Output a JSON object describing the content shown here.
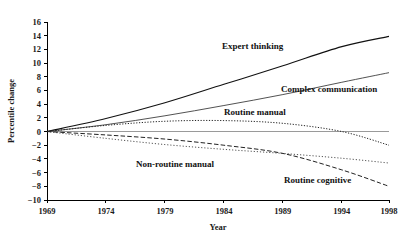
{
  "chart_data": {
    "type": "line",
    "title": "",
    "xlabel": "Year",
    "ylabel": "Percentile change",
    "x": [
      1969,
      1974,
      1979,
      1984,
      1989,
      1994,
      1998
    ],
    "xtick_labels": [
      "1969",
      "1974",
      "1979",
      "1984",
      "1989",
      "1994",
      "1998"
    ],
    "ytick_labels": [
      "16",
      "14",
      "12",
      "10",
      "8",
      "6",
      "4",
      "2",
      "0",
      "-2",
      "-4",
      "-6",
      "-8",
      "-10"
    ],
    "xlim": [
      1969,
      1998
    ],
    "ylim": [
      -10,
      16
    ],
    "grid": false,
    "legend_position": "inline-annotations",
    "series": [
      {
        "name": "Expert thinking",
        "label": "Expert thinking",
        "style": "solid",
        "values": [
          0.0,
          1.9,
          4.2,
          6.9,
          9.6,
          12.4,
          13.9
        ]
      },
      {
        "name": "Complex communication",
        "label": "Complex communication",
        "style": "solid-thin",
        "values": [
          0.0,
          1.0,
          2.3,
          3.8,
          5.4,
          7.2,
          8.6
        ]
      },
      {
        "name": "Routine manual",
        "label": "Routine manual",
        "style": "dotted",
        "values": [
          0.0,
          0.9,
          1.5,
          1.6,
          1.2,
          0.0,
          -2.0
        ]
      },
      {
        "name": "Non-routine manual",
        "label": "Non-routine manual",
        "style": "dotted-light",
        "values": [
          0.0,
          -1.0,
          -1.9,
          -2.6,
          -3.2,
          -3.9,
          -4.6
        ]
      },
      {
        "name": "Routine cognitive",
        "label": "Routine cognitive",
        "style": "dashed",
        "values": [
          0.0,
          -0.5,
          -1.1,
          -2.0,
          -3.2,
          -5.6,
          -8.0
        ]
      }
    ]
  }
}
